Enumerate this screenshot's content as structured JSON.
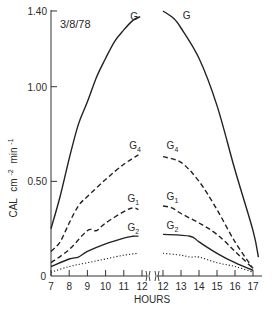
{
  "chart_data": {
    "type": "line",
    "title": "",
    "annotation": "3/8/78",
    "xlabel": "HOURS",
    "ylabel": "CAL cm⁻² min⁻¹",
    "ylabel_parts": {
      "main": "CAL",
      "unit1": "cm",
      "exp1": "-2",
      "unit2": "min",
      "exp2": "-1"
    },
    "ylim": [
      0,
      1.4
    ],
    "yticks": [
      0,
      0.5,
      1.0,
      1.4
    ],
    "ytick_labels": [
      "0",
      "0.50",
      "1.00",
      "1.40"
    ],
    "axis_break": "between 12 (left panel) and 12 (right panel)",
    "grid": false,
    "legend": "inline labels",
    "panels": [
      {
        "name": "left",
        "xlim": [
          7,
          12
        ],
        "xticks": [
          7,
          8,
          9,
          10,
          11,
          12
        ],
        "xtick_labels": [
          "7",
          "8",
          "9",
          "10",
          "11",
          "12"
        ],
        "series": [
          {
            "name": "G",
            "style": "solid",
            "x": [
              7,
              7.5,
              8,
              8.5,
              9,
              9.5,
              10,
              10.5,
              11,
              11.5,
              11.9
            ],
            "values": [
              0.25,
              0.42,
              0.62,
              0.8,
              0.92,
              1.05,
              1.15,
              1.24,
              1.3,
              1.35,
              1.37
            ]
          },
          {
            "name": "G4",
            "style": "dashed",
            "x": [
              7,
              7.5,
              8,
              8.5,
              9,
              10,
              11,
              11.8
            ],
            "values": [
              0.13,
              0.18,
              0.28,
              0.37,
              0.42,
              0.51,
              0.59,
              0.64
            ]
          },
          {
            "name": "G1",
            "style": "dashed",
            "x": [
              7,
              8,
              9,
              9.5,
              10,
              11,
              11.5,
              11.8
            ],
            "values": [
              0.07,
              0.14,
              0.24,
              0.24,
              0.28,
              0.34,
              0.36,
              0.35
            ]
          },
          {
            "name": "G2",
            "style": "solid",
            "x": [
              7,
              8,
              8.5,
              9,
              10,
              11,
              11.5,
              11.8
            ],
            "values": [
              0.05,
              0.09,
              0.1,
              0.13,
              0.17,
              0.2,
              0.21,
              0.21
            ]
          },
          {
            "name": "",
            "style": "dotted",
            "x": [
              7,
              8,
              9,
              10,
              11,
              11.8
            ],
            "values": [
              0.02,
              0.05,
              0.07,
              0.09,
              0.11,
              0.12
            ]
          }
        ]
      },
      {
        "name": "right",
        "xlim": [
          12,
          17
        ],
        "xticks": [
          12,
          13,
          14,
          15,
          16,
          17
        ],
        "xtick_labels": [
          "12",
          "13",
          "14",
          "15",
          "16",
          "17"
        ],
        "series": [
          {
            "name": "G",
            "style": "solid",
            "x": [
              12,
              12.6,
              13,
              14,
              15,
              16,
              17,
              17.3
            ],
            "values": [
              1.4,
              1.36,
              1.31,
              1.15,
              0.9,
              0.56,
              0.24,
              0.1
            ]
          },
          {
            "name": "G4",
            "style": "dashed",
            "x": [
              12,
              13,
              14,
              15,
              16,
              17
            ],
            "values": [
              0.63,
              0.6,
              0.5,
              0.35,
              0.18,
              0.04
            ]
          },
          {
            "name": "G1",
            "style": "dashed",
            "x": [
              12,
              12.5,
              13,
              14,
              15,
              16,
              17
            ],
            "values": [
              0.37,
              0.36,
              0.33,
              0.28,
              0.22,
              0.13,
              0.04
            ]
          },
          {
            "name": "G2",
            "style": "solid",
            "x": [
              12,
              13.5,
              14,
              15,
              16,
              17
            ],
            "values": [
              0.22,
              0.21,
              0.18,
              0.12,
              0.07,
              0.03
            ]
          },
          {
            "name": "",
            "style": "dotted",
            "x": [
              12,
              13,
              13.5,
              14,
              15,
              16,
              17
            ],
            "values": [
              0.12,
              0.11,
              0.1,
              0.1,
              0.07,
              0.05,
              0.02
            ]
          }
        ]
      }
    ],
    "inline_labels": [
      {
        "text": "G",
        "sub": "",
        "panel": "left",
        "x": 11.35,
        "y": 1.35
      },
      {
        "text": "G",
        "sub": "",
        "panel": "right",
        "x": 13.1,
        "y": 1.36
      },
      {
        "text": "G",
        "sub": "4",
        "panel": "left",
        "x": 11.3,
        "y": 0.67
      },
      {
        "text": "G",
        "sub": "4",
        "panel": "right",
        "x": 12.2,
        "y": 0.67
      },
      {
        "text": "G",
        "sub": "1",
        "panel": "left",
        "x": 11.2,
        "y": 0.39
      },
      {
        "text": "G",
        "sub": "1",
        "panel": "right",
        "x": 12.2,
        "y": 0.4
      },
      {
        "text": "G",
        "sub": "2",
        "panel": "left",
        "x": 11.2,
        "y": 0.24
      },
      {
        "text": "G",
        "sub": "2",
        "panel": "right",
        "x": 12.2,
        "y": 0.25
      }
    ]
  }
}
